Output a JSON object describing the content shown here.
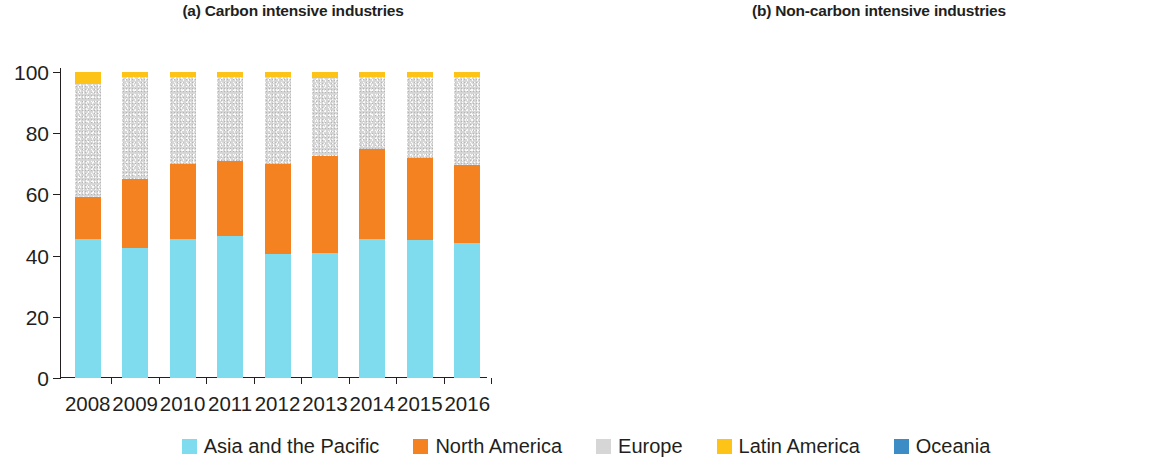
{
  "figure": {
    "panels": [
      {
        "key": "a",
        "title": "(a) Carbon intensive industries"
      },
      {
        "key": "b",
        "title": "(b) Non-carbon intensive industries"
      }
    ]
  },
  "legend": {
    "items": [
      {
        "label": "Asia and the Pacific",
        "color": "#7FDCEF",
        "icon": "legend-swatch-asia-pacific"
      },
      {
        "label": "North America",
        "color": "#F58220",
        "icon": "legend-swatch-north-america"
      },
      {
        "label": "Europe",
        "color": "#D6D6D6",
        "icon": "legend-swatch-europe"
      },
      {
        "label": "Latin America",
        "color": "#FDC417",
        "icon": "legend-swatch-latin-america"
      },
      {
        "label": "Oceania",
        "color": "#3C8DC5",
        "icon": "legend-swatch-oceania"
      }
    ]
  },
  "chart_data": [
    {
      "type": "bar",
      "stacked": true,
      "panel": "a",
      "title": "(a) Carbon intensive industries",
      "xlabel": "",
      "ylabel": "",
      "ylim": [
        0,
        100
      ],
      "yticks": [
        0,
        20,
        40,
        60,
        80,
        100
      ],
      "ytick_labels": [
        "0",
        "20",
        "40",
        "60",
        "80",
        "100"
      ],
      "grid": false,
      "legend_position": "bottom",
      "categories": [
        "2008",
        "2009",
        "2010",
        "2011",
        "2012",
        "2013",
        "2014",
        "2015",
        "2016"
      ],
      "series": [
        {
          "name": "Asia and the Pacific",
          "color": "#7FDCEF",
          "values": [
            45.5,
            42.5,
            45.5,
            46.5,
            40.5,
            41.0,
            45.5,
            45.0,
            44.0
          ]
        },
        {
          "name": "North America",
          "color": "#F58220",
          "values": [
            13.5,
            22.5,
            24.5,
            24.5,
            29.5,
            31.5,
            29.5,
            27.0,
            25.5
          ]
        },
        {
          "name": "Europe",
          "color": "#D6D6D6",
          "values": [
            37.0,
            33.5,
            28.5,
            27.5,
            28.5,
            25.5,
            23.5,
            26.5,
            29.0
          ]
        },
        {
          "name": "Latin America",
          "color": "#FDC417",
          "values": [
            4.0,
            1.5,
            1.5,
            1.5,
            1.5,
            2.0,
            1.5,
            1.5,
            1.5
          ]
        },
        {
          "name": "Oceania",
          "color": "#3C8DC5",
          "values": [
            0.0,
            0.0,
            0.0,
            0.0,
            0.0,
            0.0,
            0.0,
            0.0,
            0.0
          ]
        }
      ]
    },
    {
      "type": "bar",
      "stacked": true,
      "panel": "b",
      "title": "(b) Non-carbon intensive industries",
      "xlabel": "",
      "ylabel": "",
      "ylim": [
        0,
        100
      ],
      "yticks": [
        0,
        10,
        20,
        30,
        40,
        50,
        60,
        70,
        80,
        90,
        100
      ],
      "ytick_labels": [
        "0",
        "10",
        "20",
        "30",
        "40",
        "50",
        "60",
        "70",
        "80",
        "90",
        "100"
      ],
      "grid": false,
      "legend_position": "bottom",
      "categories": [
        "2008",
        "2009",
        "2010",
        "2011",
        "2012",
        "2013",
        "2014",
        "2015",
        "2016"
      ],
      "series": [
        {
          "name": "Asia and the Pacific",
          "color": "#7FDCEF",
          "values": [
            18.5,
            24.0,
            26.5,
            33.0,
            27.5,
            26.5,
            31.5,
            27.0,
            31.5
          ]
        },
        {
          "name": "North America",
          "color": "#F58220",
          "values": [
            4.0,
            9.0,
            11.0,
            10.5,
            13.0,
            13.0,
            19.5,
            15.0,
            11.5
          ]
        },
        {
          "name": "Europe",
          "color": "#D6D6D6",
          "values": [
            69.0,
            59.0,
            56.5,
            51.5,
            54.5,
            51.5,
            43.5,
            50.0,
            49.5
          ]
        },
        {
          "name": "Latin America",
          "color": "#FDC417",
          "values": [
            7.5,
            7.0,
            4.5,
            4.0,
            4.0,
            7.5,
            2.0,
            6.0,
            5.5
          ]
        },
        {
          "name": "Oceania",
          "color": "#3C8DC5",
          "values": [
            1.0,
            1.0,
            1.5,
            1.0,
            1.0,
            1.5,
            3.5,
            2.0,
            2.0
          ]
        }
      ]
    }
  ]
}
